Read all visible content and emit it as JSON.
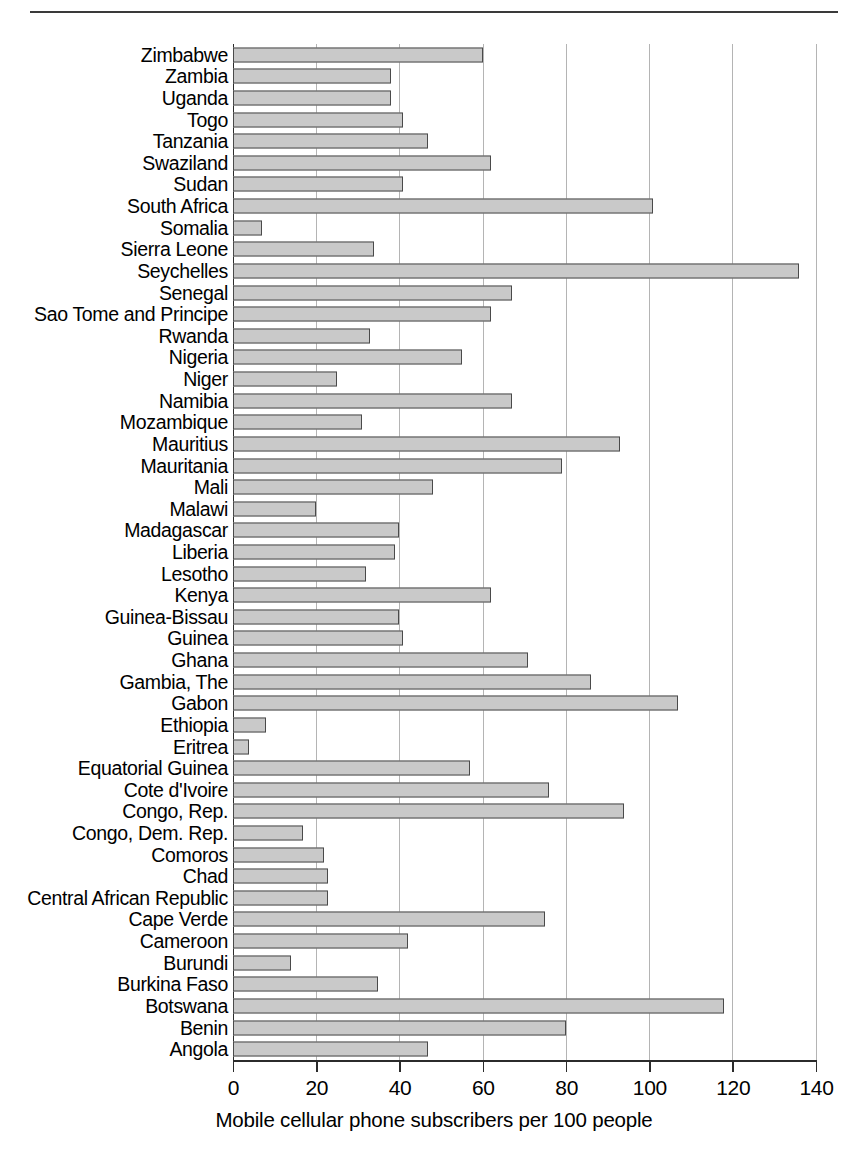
{
  "chart_data": {
    "type": "bar",
    "orientation": "horizontal",
    "title": "",
    "xlabel": "Mobile cellular phone subscribers per 100 people",
    "ylabel": "",
    "xlim": [
      0,
      140
    ],
    "xticks": [
      0,
      20,
      40,
      60,
      80,
      100,
      120,
      140
    ],
    "grid": "vertical",
    "legend": "none",
    "bar_fill": "#c9c9c9",
    "bar_edge": "#4a4a4a",
    "categories": [
      "Zimbabwe",
      "Zambia",
      "Uganda",
      "Togo",
      "Tanzania",
      "Swaziland",
      "Sudan",
      "South Africa",
      "Somalia",
      "Sierra Leone",
      "Seychelles",
      "Senegal",
      "Sao Tome and Principe",
      "Rwanda",
      "Nigeria",
      "Niger",
      "Namibia",
      "Mozambique",
      "Mauritius",
      "Mauritania",
      "Mali",
      "Malawi",
      "Madagascar",
      "Liberia",
      "Lesotho",
      "Kenya",
      "Guinea-Bissau",
      "Guinea",
      "Ghana",
      "Gambia, The",
      "Gabon",
      "Ethiopia",
      "Eritrea",
      "Equatorial Guinea",
      "Cote d'Ivoire",
      "Congo, Rep.",
      "Congo, Dem. Rep.",
      "Comoros",
      "Chad",
      "Central African Republic",
      "Cape Verde",
      "Cameroon",
      "Burundi",
      "Burkina Faso",
      "Botswana",
      "Benin",
      "Angola"
    ],
    "values": [
      60,
      38,
      38,
      41,
      47,
      62,
      41,
      101,
      7,
      34,
      136,
      67,
      62,
      33,
      55,
      25,
      67,
      31,
      93,
      79,
      48,
      20,
      40,
      39,
      32,
      62,
      40,
      41,
      71,
      86,
      107,
      8,
      4,
      57,
      76,
      94,
      17,
      22,
      23,
      23,
      75,
      42,
      14,
      35,
      118,
      80,
      47
    ]
  }
}
